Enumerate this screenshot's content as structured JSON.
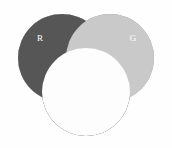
{
  "figure": {
    "name": "rgb-additive-color-venn-diagram",
    "width": 172,
    "height": 148,
    "background_color": "#fefefe"
  },
  "chart_data": {
    "type": "venn",
    "title": "",
    "subtitle": "",
    "xlabel": "",
    "ylabel": "",
    "grid": false,
    "legend_position": "none",
    "set_count": 3,
    "sets": [
      {
        "id": "R",
        "label": "R",
        "meaning": "Red channel",
        "center_x": 62,
        "center_y": 58,
        "radius": 44,
        "fill_color": "#4a4a4a",
        "label_x": 40,
        "label_y": 39,
        "label_color": "#ffffff"
      },
      {
        "id": "G",
        "label": "G",
        "meaning": "Green channel",
        "center_x": 110,
        "center_y": 58,
        "radius": 44,
        "fill_color": "#8b8b8b",
        "label_x": 133,
        "label_y": 39,
        "label_color": "#ffffff"
      },
      {
        "id": "B",
        "label": "B",
        "meaning": "Blue channel",
        "center_x": 86,
        "center_y": 92,
        "radius": 44,
        "fill_color": "#1c1c1c",
        "label_x": 88,
        "label_y": 118,
        "label_color": "#ffffff"
      }
    ],
    "intersections": [
      {
        "id": "RG",
        "sets": [
          "R",
          "G"
        ],
        "meaning": "Red + Green = Yellow",
        "fill_color": "#e9e9e9"
      },
      {
        "id": "RB",
        "sets": [
          "R",
          "B"
        ],
        "meaning": "Red + Blue = Magenta",
        "fill_color": "#565656"
      },
      {
        "id": "GB",
        "sets": [
          "G",
          "B"
        ],
        "meaning": "Green + Blue = Cyan",
        "fill_color": "#c9c9c9"
      },
      {
        "id": "RGB",
        "sets": [
          "R",
          "G",
          "B"
        ],
        "meaning": "Red + Green + Blue = White",
        "fill_color": "#fdfdfd"
      }
    ]
  }
}
